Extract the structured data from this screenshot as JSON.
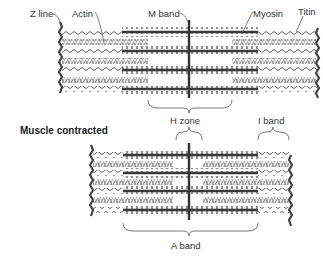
{
  "diagram": {
    "type": "sarcomere-structure",
    "colors": {
      "filament": "#555555",
      "thick": "#3a3a3a",
      "zline": "#444444",
      "text": "#333333",
      "background": "#ffffff"
    },
    "relaxed": {
      "labels": {
        "z_line": "Z line",
        "actin": "Actin",
        "m_band": "M band",
        "myosin": "Myosin",
        "titin": "Titin",
        "h_zone": "H zone",
        "i_band": "I band"
      }
    },
    "contracted": {
      "title": "Muscle contracted",
      "labels": {
        "a_band": "A band"
      }
    }
  }
}
